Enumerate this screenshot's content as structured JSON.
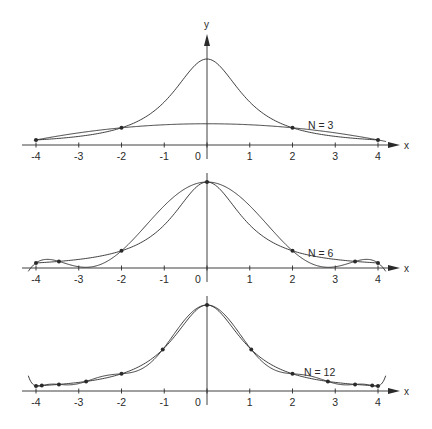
{
  "chart_data": [
    {
      "type": "line",
      "title": "",
      "label": "N = 3",
      "xlabel": "x",
      "ylabel": "y",
      "xlim": [
        -4.2,
        4.4
      ],
      "ylim": [
        0,
        1
      ],
      "xticks": [
        -4,
        -3,
        -2,
        -1,
        0,
        1,
        2,
        3,
        4
      ],
      "xtick_labels": [
        "-4",
        "-3",
        "-2",
        "-1",
        "0",
        "1",
        "2",
        "3",
        "4"
      ],
      "grid": false,
      "function": "1/(1+x^2)",
      "nodes": [
        -4,
        -2,
        2,
        4
      ],
      "series": [
        {
          "name": "f(x) = 1/(1+x^2)",
          "x": [
            -4,
            -3,
            -2,
            -1,
            0,
            1,
            2,
            3,
            4
          ],
          "values": [
            0.059,
            0.1,
            0.2,
            0.5,
            1.0,
            0.5,
            0.2,
            0.1,
            0.059
          ]
        },
        {
          "name": "interpolant N=3",
          "x": [
            -4,
            -3,
            -2,
            -1,
            0,
            1,
            2,
            3,
            4
          ],
          "values": [
            0.059,
            0.148,
            0.2,
            0.228,
            0.235,
            0.228,
            0.2,
            0.148,
            0.059
          ]
        }
      ]
    },
    {
      "type": "line",
      "title": "",
      "label": "N = 6",
      "xlabel": "x",
      "ylabel": "",
      "xlim": [
        -4.2,
        4.4
      ],
      "ylim": [
        0,
        1
      ],
      "xticks": [
        -4,
        -3,
        -2,
        -1,
        0,
        1,
        2,
        3,
        4
      ],
      "xtick_labels": [
        "-4",
        "-3",
        "-2",
        "-1",
        "0",
        "1",
        "2",
        "3",
        "4"
      ],
      "grid": false,
      "function": "1/(1+x^2)",
      "nodes": [
        -4,
        -3.464,
        -2,
        0,
        2,
        3.464,
        4
      ],
      "series": [
        {
          "name": "f(x) = 1/(1+x^2)",
          "x": [
            -4,
            -3,
            -2,
            -1,
            0,
            1,
            2,
            3,
            4
          ],
          "values": [
            0.059,
            0.1,
            0.2,
            0.5,
            1.0,
            0.5,
            0.2,
            0.1,
            0.059
          ]
        },
        {
          "name": "interpolant N=6",
          "x": [
            -4,
            -3,
            -2,
            -1,
            0,
            1,
            2,
            3,
            4
          ],
          "values": [
            0.059,
            0.0,
            0.2,
            0.72,
            1.0,
            0.72,
            0.2,
            0.0,
            0.059
          ]
        }
      ]
    },
    {
      "type": "line",
      "title": "",
      "label": "N = 12",
      "xlabel": "x",
      "ylabel": "",
      "xlim": [
        -4.2,
        4.4
      ],
      "ylim": [
        0,
        1
      ],
      "xticks": [
        -4,
        -3,
        -2,
        -1,
        0,
        1,
        2,
        3,
        4
      ],
      "xtick_labels": [
        "-4",
        "-3",
        "-2",
        "-1",
        "0",
        "1",
        "2",
        "3",
        "4"
      ],
      "grid": false,
      "function": "1/(1+x^2)",
      "nodes": [
        -4,
        -3.864,
        -3.464,
        -2.828,
        -2,
        -1.035,
        0,
        1.035,
        2,
        2.828,
        3.464,
        3.864,
        4
      ],
      "series": [
        {
          "name": "f(x) = 1/(1+x^2)",
          "x": [
            -4,
            -3,
            -2,
            -1,
            0,
            1,
            2,
            3,
            4
          ],
          "values": [
            0.059,
            0.1,
            0.2,
            0.5,
            1.0,
            0.5,
            0.2,
            0.1,
            0.059
          ]
        },
        {
          "name": "interpolant N=12",
          "x": [
            -4,
            -3,
            -2,
            -1,
            0,
            1,
            2,
            3,
            4
          ],
          "values": [
            0.059,
            0.09,
            0.2,
            0.52,
            1.0,
            0.52,
            0.2,
            0.09,
            0.059
          ]
        }
      ]
    }
  ],
  "panels": [
    {
      "label": "N = 3",
      "axis_label_x": "x",
      "axis_label_y": "y"
    },
    {
      "label": "N = 6",
      "axis_label_x": "x"
    },
    {
      "label": "N = 12",
      "axis_label_x": "x"
    }
  ],
  "colors": {
    "ink": "#2a2a2a",
    "background": "#ffffff"
  }
}
